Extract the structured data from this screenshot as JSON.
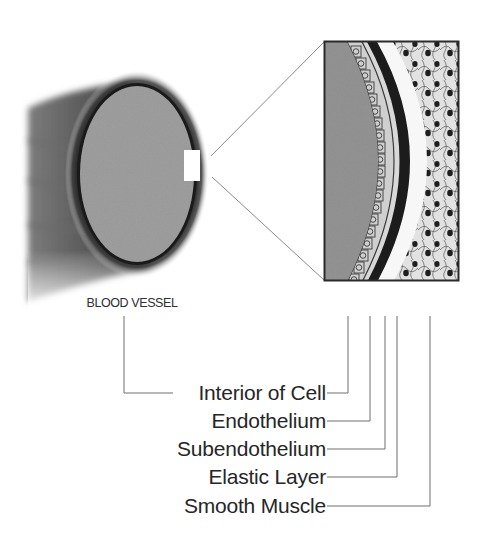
{
  "diagram": {
    "type": "anatomical-cross-section",
    "colors": {
      "background": "#ffffff",
      "vessel_body": "#5a5a5a",
      "lumen": "#9a9a9a",
      "leader_line": "#6e6e6e",
      "text": "#262626",
      "nucleus": "#1e1e1e"
    }
  },
  "vessel": {
    "caption": "BLOOD VESSEL"
  },
  "callouts": [
    {
      "id": "interior",
      "label": "Interior of Cell"
    },
    {
      "id": "endothelium",
      "label": "Endothelium"
    },
    {
      "id": "subendothelium",
      "label": "Subendothelium"
    },
    {
      "id": "elastic",
      "label": "Elastic Layer"
    },
    {
      "id": "smooth-muscle",
      "label": "Smooth Muscle"
    }
  ]
}
